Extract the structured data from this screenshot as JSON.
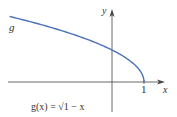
{
  "chart_data": {
    "type": "line",
    "title": "",
    "function_label": "g(x) = √1 − x",
    "curve_label": "g",
    "xlabel": "x",
    "ylabel": "y",
    "x_ticks": [
      "1"
    ],
    "series": [
      {
        "name": "g",
        "x": [
          -3.2,
          -3,
          -2.5,
          -2,
          -1.5,
          -1,
          -0.5,
          0,
          0.25,
          0.5,
          0.75,
          0.9,
          1
        ],
        "values": [
          2.05,
          2.0,
          1.87,
          1.73,
          1.58,
          1.41,
          1.22,
          1.0,
          0.87,
          0.71,
          0.5,
          0.32,
          0
        ]
      }
    ],
    "xlim": [
      -3.5,
      2.1
    ],
    "ylim": [
      -1.1,
      2.6
    ],
    "grid": false,
    "legend": "none"
  },
  "colors": {
    "curve": "#4a72b8",
    "axis": "#333333"
  }
}
